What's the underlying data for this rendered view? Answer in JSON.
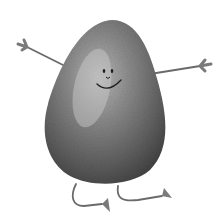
{
  "illustration": {
    "subject": "Cartoon avocado character with arms, legs and smiling face",
    "style": "grayscale watercolor",
    "colors": {
      "background": "#ffffff",
      "body_dark": "#3a3a3a",
      "body_mid": "#6e6e6e",
      "body_light": "#b8b8b8",
      "limbs": "#6a6a6a",
      "face": "#1e1e1e"
    }
  }
}
